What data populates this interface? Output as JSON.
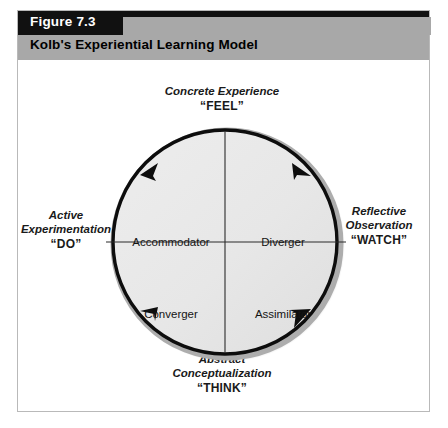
{
  "figure": {
    "number_label": "Figure 7.3",
    "title": "Kolb's Experiential Learning Model"
  },
  "diagram": {
    "type": "cycle-quadrant",
    "axes": [
      {
        "position": "top",
        "name": "concrete-experience",
        "line1": "Concrete Experience",
        "line2": "",
        "keyword": "“FEEL”"
      },
      {
        "position": "right",
        "name": "reflective-observation",
        "line1": "Reflective",
        "line2": "Observation",
        "keyword": "“WATCH”"
      },
      {
        "position": "bottom",
        "name": "abstract-conceptualization",
        "line1": "Abstract",
        "line2": "Conceptualization",
        "keyword": "“THINK”"
      },
      {
        "position": "left",
        "name": "active-experimentation",
        "line1": "Active",
        "line2": "Experimentation",
        "keyword": "“DO”"
      }
    ],
    "quadrants": [
      {
        "position": "top-left",
        "label": "Accommodator"
      },
      {
        "position": "top-right",
        "label": "Diverger"
      },
      {
        "position": "bottom-left",
        "label": "Converger"
      },
      {
        "position": "bottom-right",
        "label": "Assimilator"
      }
    ],
    "cycle_direction": "clockwise",
    "arrow_count": 4
  },
  "colors": {
    "header_bar": "#111111",
    "header_band": "#a8a8a8",
    "frame_border": "#b9b9b9",
    "circle_fill": "#e8e8e8",
    "circle_ring": "#0d0d0d",
    "circle_shadow": "#b0b0b0",
    "page_background": "#ffffff",
    "text": "#141414"
  }
}
